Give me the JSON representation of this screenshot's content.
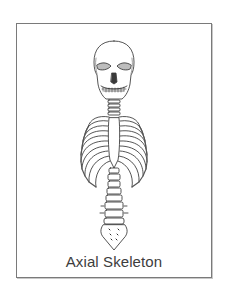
{
  "figure": {
    "caption": "Axial Skeleton",
    "parts": [
      "skull",
      "cervical-vertebrae",
      "rib-cage",
      "sternum",
      "lumbar-vertebrae",
      "sacrum"
    ],
    "colors": {
      "line": "#2a2a2a",
      "frame": "#7a7a7a",
      "caption": "#3d3d3d",
      "background": "#ffffff"
    }
  }
}
